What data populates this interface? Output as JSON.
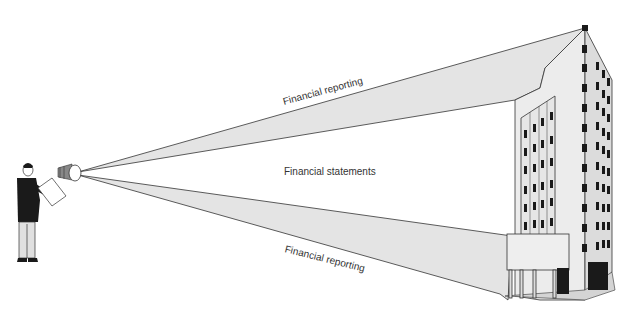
{
  "diagram": {
    "labels": {
      "top_beam": "Financial reporting",
      "center": "Financial statements",
      "bottom_beam": "Financial reporting"
    },
    "elements": {
      "observer": "person-with-clipboard",
      "instrument": "telescope",
      "subject": "office-building"
    },
    "colors": {
      "beam_fill": "#e4e4e4",
      "outline": "#333333",
      "building_face": "#ececec",
      "building_side": "#d8d8d8",
      "window": "#1a1a1a",
      "text": "#333333"
    }
  }
}
